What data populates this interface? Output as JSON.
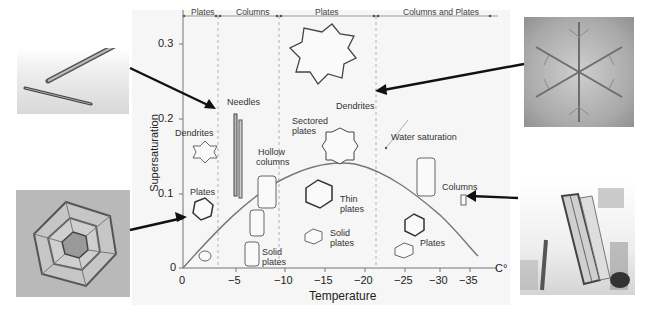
{
  "diagram": {
    "x_axis": {
      "label": "Temperature",
      "unit": "C°",
      "ticks": [
        "0",
        "−5",
        "−10",
        "−15",
        "−20",
        "−25",
        "−30",
        "−35"
      ]
    },
    "y_axis": {
      "label": "Supersaturation",
      "ticks": [
        "0",
        "0.1",
        "0.2",
        "0.3"
      ]
    },
    "regimes": [
      {
        "label": "Plates",
        "range": "0 to −3"
      },
      {
        "label": "Columns",
        "range": "−3 to −10"
      },
      {
        "label": "Plates",
        "range": "−10 to −22"
      },
      {
        "label": "Columns and Plates",
        "range": "−22 to −40"
      }
    ],
    "curve_label": "Water saturation",
    "crystal_labels": {
      "dendrites_left": "Dendrites",
      "plates_left": "Plates",
      "needles": "Needles",
      "hollow_columns": [
        "Hollow",
        "columns"
      ],
      "solid_plates_left": [
        "Solid",
        "plates"
      ],
      "dendrites_top": "Dendrites",
      "sectored_plates": [
        "Sectored",
        "plates"
      ],
      "thin_plates": [
        "Thin",
        "plates"
      ],
      "solid_plates_mid": [
        "Solid",
        "plates"
      ],
      "plates_right": "Plates",
      "columns_right": "Columns"
    },
    "photos": [
      {
        "name": "needle-crystals-photo",
        "position": "top-left"
      },
      {
        "name": "hexagonal-plate-photo",
        "position": "bottom-left"
      },
      {
        "name": "dendrite-star-photo",
        "position": "top-right"
      },
      {
        "name": "column-crystals-photo",
        "position": "bottom-right"
      }
    ]
  }
}
